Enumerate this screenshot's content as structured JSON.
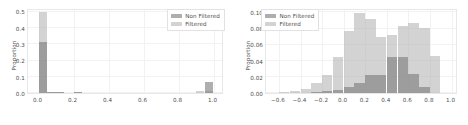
{
  "figure": {
    "background": "#ffffff",
    "panel_count": 2,
    "style": "whitegrid",
    "colors": {
      "non_filtered": "#7d7d7d",
      "filtered": "#afafaf",
      "grid": "#f2f2f4",
      "text": "#4d4d4d"
    }
  },
  "chart_data": [
    {
      "type": "bar",
      "title": "",
      "xlabel": "",
      "ylabel": "Proportion",
      "xlim": [
        -0.06,
        1.06
      ],
      "ylim": [
        0.0,
        0.52
      ],
      "xticks": [
        "0.0",
        "0.2",
        "0.4",
        "0.6",
        "0.8",
        "1.0"
      ],
      "xtick_values": [
        0.0,
        0.2,
        0.4,
        0.6,
        0.8,
        1.0
      ],
      "yticks": [
        "0.0",
        "0.1",
        "0.2",
        "0.3",
        "0.4",
        "0.5"
      ],
      "ytick_values": [
        0.0,
        0.1,
        0.2,
        0.3,
        0.4,
        0.5
      ],
      "grid": true,
      "legend_position": "upper right",
      "bin_edges": [
        0.0,
        0.05,
        0.1,
        0.15,
        0.2,
        0.25,
        0.3,
        0.35,
        0.4,
        0.45,
        0.5,
        0.55,
        0.6,
        0.65,
        0.7,
        0.75,
        0.8,
        0.85,
        0.9,
        0.95,
        1.0
      ],
      "series": [
        {
          "name": "Non Filtered",
          "color": "#7d7d7d",
          "values": [
            0.313,
            0.004,
            0.002,
            0.0,
            0.003,
            0.0,
            0.0,
            0.0,
            0.0,
            0.0,
            0.0,
            0.0,
            0.0,
            0.0,
            0.0,
            0.0,
            0.0,
            0.0,
            0.0,
            0.069
          ]
        },
        {
          "name": "Filtered",
          "color": "#afafaf",
          "values": [
            0.497,
            0.006,
            0.003,
            0.0,
            0.004,
            0.0,
            0.0,
            0.0,
            0.0,
            0.0,
            0.0,
            0.0,
            0.0,
            0.0,
            0.0,
            0.0,
            0.0,
            0.0,
            0.011,
            0.014
          ]
        }
      ]
    },
    {
      "type": "bar",
      "title": "",
      "xlabel": "",
      "ylabel": "Proportion",
      "xlim": [
        -0.72,
        1.06
      ],
      "ylim": [
        0.0,
        0.105
      ],
      "xticks": [
        "−0.6",
        "−0.4",
        "−0.2",
        "0.0",
        "0.2",
        "0.4",
        "0.6",
        "0.8",
        "1.0"
      ],
      "xtick_values": [
        -0.6,
        -0.4,
        -0.2,
        0.0,
        0.2,
        0.4,
        0.6,
        0.8,
        1.0
      ],
      "yticks": [
        "0.00",
        "0.02",
        "0.04",
        "0.06",
        "0.08",
        "0.10"
      ],
      "ytick_values": [
        0.0,
        0.02,
        0.04,
        0.06,
        0.08,
        0.1
      ],
      "grid": true,
      "legend_position": "upper left",
      "bin_edges": [
        -0.7,
        -0.6,
        -0.5,
        -0.4,
        -0.3,
        -0.2,
        -0.1,
        0.0,
        0.1,
        0.2,
        0.3,
        0.4,
        0.5,
        0.6,
        0.7,
        0.8,
        0.9,
        1.0
      ],
      "series": [
        {
          "name": "Non Filtered",
          "color": "#7d7d7d",
          "values": [
            0.0,
            0.0,
            0.0,
            0.0,
            0.001,
            0.002,
            0.004,
            0.007,
            0.012,
            0.022,
            0.022,
            0.045,
            0.044,
            0.023,
            0.008,
            0.0,
            0.0
          ]
        },
        {
          "name": "Filtered",
          "color": "#afafaf",
          "values": [
            0.0,
            0.001,
            0.002,
            0.005,
            0.012,
            0.022,
            0.045,
            0.077,
            0.099,
            0.091,
            0.069,
            0.072,
            0.083,
            0.086,
            0.08,
            0.046,
            0.0
          ]
        }
      ]
    }
  ],
  "legend": {
    "entries": [
      {
        "label": "Non Filtered",
        "swatch": "non-filtered-swatch"
      },
      {
        "label": "Filtered",
        "swatch": "filtered-swatch"
      }
    ]
  }
}
